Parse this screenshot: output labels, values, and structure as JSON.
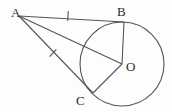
{
  "figure": {
    "type": "geometry-diagram",
    "background_color": "#fdfdfd",
    "stroke_color": "#54545a",
    "label_color": "#2b2b2b",
    "width": 172,
    "height": 112
  },
  "circle": {
    "name": "circle-O",
    "center_x": 122,
    "center_y": 64,
    "radius": 42
  },
  "points": {
    "A": {
      "label": "A",
      "x": 19,
      "y": 16,
      "role": "external-point"
    },
    "B": {
      "label": "B",
      "x": 124,
      "y": 22,
      "role": "tangent-point"
    },
    "O": {
      "label": "O",
      "x": 122,
      "y": 64,
      "role": "center"
    },
    "C": {
      "label": "C",
      "x": 93,
      "y": 93,
      "role": "tangent-point"
    }
  },
  "segments": [
    {
      "name": "AB",
      "from": "A",
      "to": "B",
      "tick_marks": 1,
      "description": "tangent segment A to B"
    },
    {
      "name": "AC",
      "from": "A",
      "to": "C",
      "tick_marks": 1,
      "description": "tangent segment A to C"
    },
    {
      "name": "AO",
      "from": "A",
      "to": "O",
      "tick_marks": 0,
      "description": "segment A to center O"
    },
    {
      "name": "OB",
      "from": "O",
      "to": "B",
      "tick_marks": 0,
      "description": "radius O to B"
    },
    {
      "name": "OC",
      "from": "O",
      "to": "C",
      "tick_marks": 0,
      "description": "radius O to C"
    }
  ],
  "tick_marks": [
    {
      "name": "tick-on-AB",
      "x": 68,
      "y": 16,
      "angle_deg": 3
    },
    {
      "name": "tick-on-AC",
      "x": 53,
      "y": 53,
      "angle_deg": 38
    }
  ]
}
